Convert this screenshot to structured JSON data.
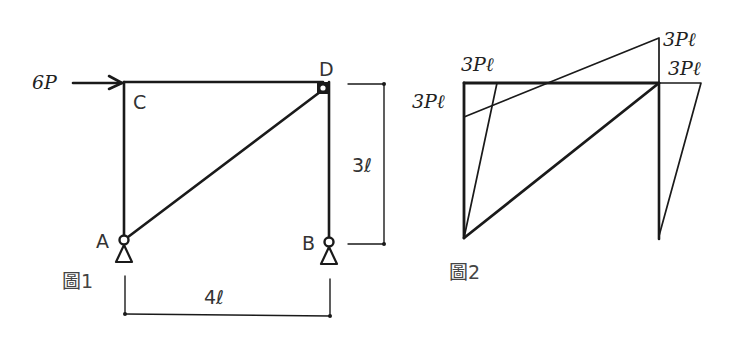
{
  "figure1": {
    "caption": "圖1",
    "load_label": "6P",
    "nodes": {
      "A": "A",
      "B": "B",
      "C": "C",
      "D": "D"
    },
    "dimensions": {
      "height": "3ℓ",
      "width": "4ℓ"
    },
    "members": [
      "A-C",
      "C-D",
      "D-B",
      "A-D"
    ],
    "supports": [
      "A: pin",
      "B: pin"
    ],
    "hinges": [
      "A",
      "B",
      "D"
    ]
  },
  "figure2": {
    "caption": "圖2",
    "moment_labels": {
      "left_column": "3Pℓ",
      "top_left": "3Pℓ",
      "top_right_upper": "3Pℓ",
      "top_right_lower": "3Pℓ"
    }
  },
  "colors": {
    "line": "#1a1a1a",
    "text": "#333333",
    "background": "#ffffff"
  }
}
